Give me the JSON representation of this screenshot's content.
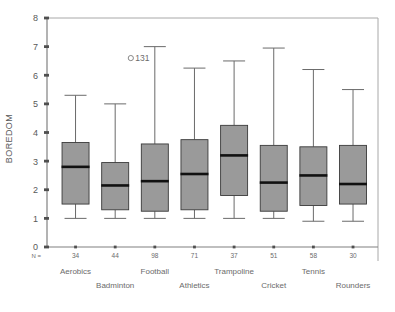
{
  "chart_data": {
    "type": "box",
    "title": "",
    "xlabel": "",
    "ylabel": "BOREDOM",
    "ylim": [
      0,
      8
    ],
    "ytick_labels": [
      "0",
      "1",
      "2",
      "3",
      "4",
      "5",
      "6",
      "7",
      "8"
    ],
    "grid": false,
    "legend": "none",
    "n_prefix": "N =",
    "categories": [
      "Aerobics",
      "Badminton",
      "Football",
      "Athletics",
      "Trampoline",
      "Cricket",
      "Tennis",
      "Rounders"
    ],
    "counts": [
      34,
      44,
      98,
      71,
      37,
      51,
      58,
      30
    ],
    "boxes": [
      {
        "category": "Aerobics",
        "n": 34,
        "whisker_low": 1.0,
        "q1": 1.5,
        "median": 2.8,
        "q3": 3.65,
        "whisker_high": 5.3
      },
      {
        "category": "Badminton",
        "n": 44,
        "whisker_low": 1.0,
        "q1": 1.3,
        "median": 2.15,
        "q3": 2.95,
        "whisker_high": 5.0
      },
      {
        "category": "Football",
        "n": 98,
        "whisker_low": 1.0,
        "q1": 1.25,
        "median": 2.3,
        "q3": 3.6,
        "whisker_high": 7.0
      },
      {
        "category": "Athletics",
        "n": 71,
        "whisker_low": 1.0,
        "q1": 1.3,
        "median": 2.55,
        "q3": 3.75,
        "whisker_high": 6.25
      },
      {
        "category": "Trampoline",
        "n": 37,
        "whisker_low": 1.0,
        "q1": 1.8,
        "median": 3.2,
        "q3": 4.25,
        "whisker_high": 6.5
      },
      {
        "category": "Cricket",
        "n": 51,
        "whisker_low": 1.0,
        "q1": 1.25,
        "median": 2.25,
        "q3": 3.55,
        "whisker_high": 6.95
      },
      {
        "category": "Tennis",
        "n": 58,
        "whisker_low": 0.9,
        "q1": 1.45,
        "median": 2.5,
        "q3": 3.5,
        "whisker_high": 6.2
      },
      {
        "category": "Rounders",
        "n": 30,
        "whisker_low": 0.9,
        "q1": 1.5,
        "median": 2.2,
        "q3": 3.55,
        "whisker_high": 5.5
      }
    ],
    "outliers": [
      {
        "label": "131",
        "category": "Football",
        "value": 6.6,
        "marker": "circle"
      }
    ]
  },
  "style": {
    "box_fill": "#9a9a9a",
    "box_stroke": "#3a3a3a",
    "median_color": "#111111",
    "whisker_color": "#6a6a6a",
    "axis_color": "#808080",
    "frame_color": "#a8a8a8",
    "text_color": "#5f5f5f",
    "background": "#ffffff"
  }
}
